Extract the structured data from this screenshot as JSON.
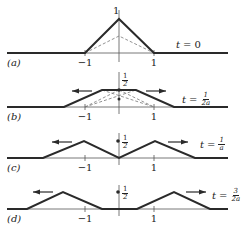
{
  "figure": {
    "panels": [
      {
        "id": "a",
        "label": "(a)",
        "time_label": {
          "var": "t",
          "eq": "=",
          "value": "0",
          "num": "",
          "den": ""
        },
        "baseline_y": 53,
        "shape": [
          [
            7,
            53
          ],
          [
            85,
            53
          ],
          [
            119,
            19
          ],
          [
            154,
            53
          ],
          [
            228,
            53
          ]
        ],
        "dashed": [
          [
            [
              85,
              53
            ],
            [
              119,
              36
            ],
            [
              154,
              53
            ]
          ]
        ],
        "value_label": "1",
        "value_label_pos": [
          113,
          6
        ],
        "dot": null,
        "arrows": [],
        "ticks": [
          {
            "x": 85,
            "label": "−1"
          },
          {
            "x": 154,
            "label": "1"
          }
        ],
        "axis_top": 10,
        "axis_bottom": 62,
        "label_pos": [
          7,
          58
        ],
        "time_pos": [
          176,
          40
        ]
      },
      {
        "id": "b",
        "label": "(b)",
        "time_label": {
          "var": "t",
          "eq": "=",
          "value": "",
          "num": "1",
          "den": "2a"
        },
        "baseline_y": 107,
        "shape": [
          [
            7,
            107
          ],
          [
            64,
            107
          ],
          [
            102,
            90
          ],
          [
            136,
            90
          ],
          [
            174,
            107
          ],
          [
            228,
            107
          ]
        ],
        "dashed": [
          [
            [
              85,
              107
            ],
            [
              119,
              90
            ]
          ],
          [
            [
              119,
              90
            ],
            [
              154,
              107
            ]
          ],
          [
            [
              102,
              90
            ],
            [
              154,
              107
            ]
          ],
          [
            [
              85,
              107
            ],
            [
              136,
              90
            ]
          ]
        ],
        "value_label": "",
        "value_frac": {
          "num": "1",
          "den": "2"
        },
        "value_label_pos": [
          122,
          73
        ],
        "dot": [
          119,
          90
        ],
        "dot2": [
          119,
          99
        ],
        "arrows": [
          {
            "x1": 92,
            "x2": 72,
            "y": 91
          },
          {
            "x1": 146,
            "x2": 166,
            "y": 91
          }
        ],
        "ticks": [
          {
            "x": 85,
            "label": "−1"
          },
          {
            "x": 154,
            "label": "1"
          }
        ],
        "axis_top": 72,
        "axis_bottom": 114,
        "label_pos": [
          7,
          112
        ],
        "time_pos": [
          182,
          92
        ]
      },
      {
        "id": "c",
        "label": "(c)",
        "time_label": {
          "var": "t",
          "eq": "=",
          "value": "",
          "num": "1",
          "den": "a"
        },
        "baseline_y": 158,
        "shape": [
          [
            7,
            158
          ],
          [
            43,
            158
          ],
          [
            84,
            141
          ],
          [
            119,
            158
          ],
          [
            155,
            141
          ],
          [
            195,
            158
          ],
          [
            228,
            158
          ]
        ],
        "dashed": [],
        "value_label": "",
        "value_frac": {
          "num": "1",
          "den": "2"
        },
        "value_label_pos": [
          122,
          135
        ],
        "dot": [
          118,
          141
        ],
        "arrows": [
          {
            "x1": 72,
            "x2": 52,
            "y": 142
          },
          {
            "x1": 168,
            "x2": 188,
            "y": 142
          }
        ],
        "ticks": [
          {
            "x": 85,
            "label": "−1"
          },
          {
            "x": 154,
            "label": "1"
          }
        ],
        "axis_top": 133,
        "axis_bottom": 165,
        "label_pos": [
          7,
          163
        ],
        "time_pos": [
          200,
          137
        ]
      },
      {
        "id": "d",
        "label": "(d)",
        "time_label": {
          "var": "t",
          "eq": "=",
          "value": "",
          "num": "3",
          "den": "2a"
        },
        "baseline_y": 209,
        "shape": [
          [
            7,
            209
          ],
          [
            27,
            209
          ],
          [
            63,
            192
          ],
          [
            102,
            209
          ],
          [
            137,
            209
          ],
          [
            174,
            192
          ],
          [
            210,
            209
          ],
          [
            228,
            209
          ]
        ],
        "dashed": [],
        "value_label": "",
        "value_frac": {
          "num": "1",
          "den": "2"
        },
        "value_label_pos": [
          122,
          186
        ],
        "dot": [
          118,
          192
        ],
        "arrows": [
          {
            "x1": 53,
            "x2": 33,
            "y": 192
          },
          {
            "x1": 186,
            "x2": 206,
            "y": 192
          }
        ],
        "ticks": [
          {
            "x": 85,
            "label": "−1"
          },
          {
            "x": 154,
            "label": "1"
          }
        ],
        "axis_top": 185,
        "axis_bottom": 216,
        "label_pos": [
          7,
          214
        ],
        "time_pos": [
          212,
          188
        ]
      }
    ],
    "colors": {
      "stroke": "#2a2a2a",
      "thin": "#555555",
      "dashed": "#777777"
    }
  }
}
